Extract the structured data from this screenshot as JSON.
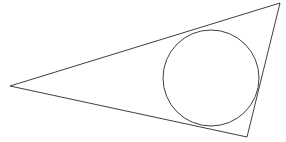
{
  "figure": {
    "type": "geometric-diagram",
    "canvas": {
      "width": 286,
      "height": 142,
      "background_color": "#ffffff"
    },
    "style": {
      "stroke_color": "#3f3f3f",
      "stroke_width": 1,
      "fill": "none"
    },
    "triangle": {
      "name": "scalene-triangle",
      "vertices": [
        {
          "label": "left-vertex",
          "x": 10,
          "y": 86
        },
        {
          "label": "top-right-vertex",
          "x": 280,
          "y": 3
        },
        {
          "label": "bottom-right-vertex",
          "x": 247,
          "y": 137
        }
      ],
      "points_attr": "10,86 280,3 247,137",
      "sides": [
        {
          "name": "upper-long-side",
          "from": "left-vertex",
          "to": "top-right-vertex"
        },
        {
          "name": "right-short-side",
          "from": "top-right-vertex",
          "to": "bottom-right-vertex"
        },
        {
          "name": "lower-long-side",
          "from": "bottom-right-vertex",
          "to": "left-vertex"
        }
      ]
    },
    "incircle": {
      "name": "inscribed-circle",
      "center_x": 211,
      "center_y": 78,
      "radius": 48,
      "tangent_points": [
        {
          "side": "upper-long-side",
          "x": 222,
          "y": 30
        },
        {
          "side": "lower-long-side",
          "x": 200,
          "y": 126
        },
        {
          "side": "right-short-side",
          "x": 257,
          "y": 83
        }
      ]
    }
  }
}
